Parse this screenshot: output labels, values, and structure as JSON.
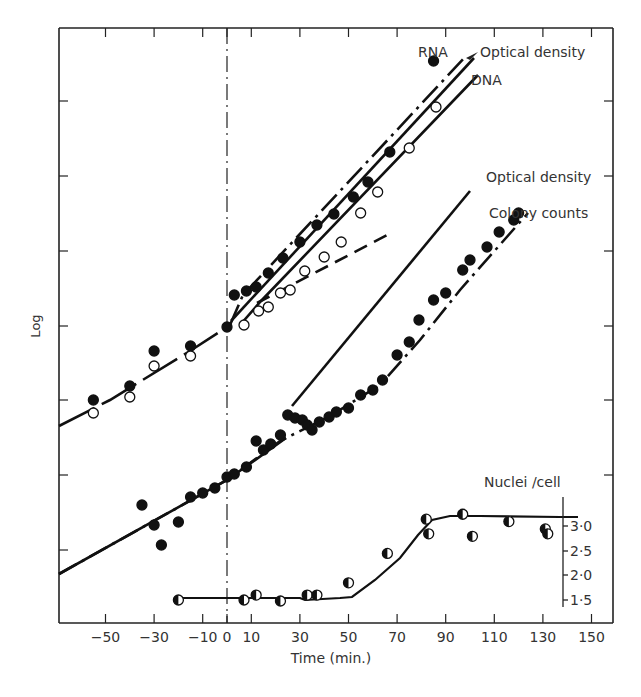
{
  "chart_data": {
    "type": "scatter",
    "title": "",
    "xlabel": "Time (min.)",
    "ylabel": "Log",
    "xlim": [
      -60,
      155
    ],
    "x_ticks": [
      -50,
      -30,
      -10,
      0,
      10,
      30,
      50,
      70,
      90,
      110,
      130,
      150
    ],
    "x_tick_labels": [
      "−50",
      "−30",
      "−10",
      "0",
      "10",
      "30",
      "50",
      "70",
      "90",
      "110",
      "130",
      "150"
    ],
    "grid": false,
    "annotations": [
      {
        "text": "RNA",
        "near": "top upper curve"
      },
      {
        "text": "Optical density",
        "near": "top, arrow to middle line"
      },
      {
        "text": "DNA",
        "near": "top lower curve"
      },
      {
        "text": "Optical density",
        "near": "middle solid line"
      },
      {
        "text": "Colony counts",
        "near": "middle dotted curve"
      },
      {
        "text": "Nuclei /cell",
        "near": "bottom curve with secondary axis"
      }
    ],
    "vertical_reference_line": {
      "x": 0,
      "style": "dash-dot"
    },
    "secondary_axis": {
      "label": "Nuclei /cell",
      "ticks": [
        1.5,
        2.0,
        2.5,
        3.0
      ],
      "tick_labels": [
        "1·5",
        "2·0",
        "2·5",
        "3·0"
      ]
    },
    "series": [
      {
        "name": "RNA",
        "marker": "filled-circle",
        "line": "dash-dot",
        "x": [
          -55,
          -40,
          -30,
          -15,
          0,
          3,
          8,
          12,
          17,
          23,
          30,
          37,
          44,
          52,
          58,
          67,
          85
        ],
        "y_px": [
          400,
          386,
          351,
          346,
          327,
          295,
          291,
          287,
          273,
          258,
          242,
          225,
          214,
          197,
          182,
          152,
          61
        ]
      },
      {
        "name": "DNA",
        "marker": "open-circle",
        "line": "solid",
        "x": [
          -55,
          -40,
          -30,
          -15,
          7,
          13,
          17,
          22,
          26,
          32,
          40,
          47,
          55,
          62,
          75,
          86
        ],
        "y_px": [
          413,
          397,
          366,
          356,
          325,
          311,
          307,
          293,
          290,
          271,
          257,
          242,
          213,
          192,
          148,
          107
        ]
      },
      {
        "name": "Optical density (upper)",
        "marker": "none",
        "line": "solid",
        "x": [
          0,
          90
        ],
        "y_px": [
          320,
          59
        ]
      },
      {
        "name": "Pre-shift extrapolation",
        "marker": "none",
        "line": "dashed",
        "x": [
          10,
          70
        ],
        "y_px": [
          305,
          232
        ]
      },
      {
        "name": "Optical density (lower)",
        "marker": "none",
        "line": "solid",
        "x": [
          -60,
          0,
          100
        ],
        "y_px": [
          574,
          480,
          171
        ]
      },
      {
        "name": "Colony counts",
        "marker": "filled-circle",
        "line": "dash-dot",
        "x": [
          -35,
          -30,
          -27,
          -20,
          -15,
          -10,
          -5,
          0,
          3,
          8,
          12,
          15,
          18,
          22,
          25,
          28,
          31,
          33,
          35,
          38,
          42,
          45,
          50,
          55,
          60,
          64,
          70,
          75,
          79,
          85,
          90,
          97,
          100,
          107,
          112,
          118,
          120
        ],
        "y_px": [
          505,
          525,
          545,
          522,
          497,
          493,
          488,
          477,
          474,
          467,
          441,
          450,
          444,
          435,
          415,
          418,
          420,
          425,
          430,
          422,
          417,
          412,
          408,
          395,
          390,
          380,
          355,
          342,
          320,
          300,
          293,
          270,
          260,
          247,
          232,
          220,
          213
        ]
      },
      {
        "name": "Nuclei /cell",
        "marker": "half-filled-circle",
        "line": "solid",
        "x": [
          -20,
          7,
          12,
          22,
          33,
          37,
          50,
          66,
          82,
          83,
          97,
          101,
          116,
          131,
          132
        ],
        "y": [
          1.5,
          1.5,
          1.6,
          1.48,
          1.6,
          1.6,
          1.85,
          2.45,
          3.15,
          2.85,
          3.25,
          2.8,
          3.1,
          2.95,
          2.85
        ]
      }
    ]
  }
}
